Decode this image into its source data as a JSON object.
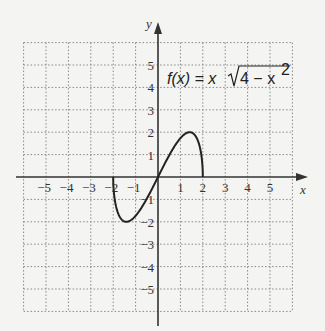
{
  "chart_data": {
    "type": "line",
    "equation_label": {
      "lhs": "f(x) = x",
      "radicand": "4 − x",
      "exponent": "2"
    },
    "xlabel": "x",
    "ylabel": "y",
    "xlim": [
      -6,
      6
    ],
    "ylim": [
      -6,
      6
    ],
    "grid": true,
    "x_ticks": [
      -5,
      -4,
      -3,
      -2,
      -1,
      1,
      2,
      3,
      4,
      5
    ],
    "y_ticks": [
      -5,
      -4,
      -3,
      -2,
      -1,
      1,
      2,
      3,
      4,
      5
    ],
    "x_tick_labels": [
      "−5",
      "−4",
      "−3",
      "−2",
      "−1",
      "1",
      "2",
      "3",
      "4",
      "5"
    ],
    "y_tick_labels": [
      "−5",
      "−4",
      "−3",
      "−2",
      "−1",
      "1",
      "2",
      "3",
      "4",
      "5"
    ],
    "series": [
      {
        "name": "f(x) = x√(4 − x²)",
        "domain": [
          -2,
          2
        ],
        "x": [
          -2,
          -1.9,
          -1.75,
          -1.5,
          -1.414,
          -1.25,
          -1,
          -0.5,
          0,
          0.5,
          1,
          1.25,
          1.414,
          1.5,
          1.75,
          1.9,
          2
        ],
        "y": [
          0,
          -1.19,
          -1.69,
          -1.98,
          -2,
          -1.95,
          -1.73,
          -0.97,
          0,
          0.97,
          1.73,
          1.95,
          2,
          1.98,
          1.69,
          1.19,
          0
        ]
      }
    ]
  }
}
